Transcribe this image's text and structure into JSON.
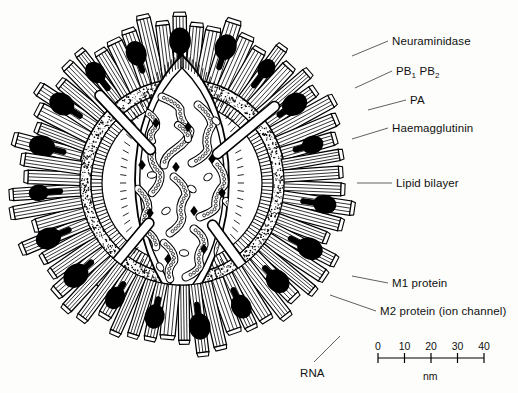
{
  "figure": {
    "background_color": "#fdfdfb",
    "ink_color": "#000000"
  },
  "labels": [
    {
      "id": "neuraminidase",
      "text": "Neuraminidase",
      "x": 392,
      "y": 36,
      "leader": [
        388,
        41,
        352,
        56
      ]
    },
    {
      "id": "pb1pb2",
      "text": "PB",
      "sub1": "1",
      "text2": "PB",
      "sub2": "2",
      "x": 396,
      "y": 66,
      "leader": [
        392,
        71,
        355,
        88
      ]
    },
    {
      "id": "pa",
      "text": "PA",
      "x": 410,
      "y": 95,
      "leader": [
        406,
        100,
        368,
        110
      ]
    },
    {
      "id": "haemagglutinin",
      "text": "Haemagglutinin",
      "x": 392,
      "y": 123,
      "leader": [
        388,
        128,
        352,
        139
      ]
    },
    {
      "id": "lipid-bilayer",
      "text": "Lipid bilayer",
      "x": 396,
      "y": 178,
      "leader": [
        392,
        183,
        357,
        183
      ]
    },
    {
      "id": "m1-protein",
      "text": "M1 protein",
      "x": 392,
      "y": 278,
      "leader": [
        388,
        283,
        352,
        276
      ]
    },
    {
      "id": "m2-protein",
      "text": "M2 protein (ion channel)",
      "x": 380,
      "y": 306,
      "leader": [
        376,
        311,
        330,
        295
      ]
    },
    {
      "id": "rna",
      "text": "RNA",
      "x": 300,
      "y": 368,
      "leader": [
        314,
        362,
        340,
        336
      ]
    }
  ],
  "scale_bar": {
    "unit": "nm",
    "ticks": [
      "0",
      "10",
      "20",
      "30",
      "40"
    ],
    "x_start": 378,
    "x_end": 484,
    "y_axis": 358,
    "label_y": 340,
    "unit_x": 423,
    "unit_y": 370
  },
  "structure": {
    "center_x": 182,
    "center_y": 183,
    "outer_radius": 176,
    "membrane_radius": 104,
    "core_half_width": 62,
    "core_half_height": 128,
    "spike_count": 58,
    "neuraminidase_count": 22,
    "rna_segment_count": 12,
    "polymerase_count": 9,
    "m2_rod_count": 4
  }
}
